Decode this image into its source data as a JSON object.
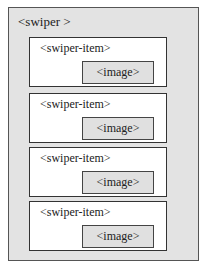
{
  "diagram": {
    "container": {
      "label": "<swiper >"
    },
    "items": [
      {
        "label": "<swiper-item>",
        "child": "<image>"
      },
      {
        "label": "<swiper-item>",
        "child": "<image>"
      },
      {
        "label": "<swiper-item>",
        "child": "<image>"
      },
      {
        "label": "<swiper-item>",
        "child": "<image>"
      }
    ],
    "colors": {
      "container_bg": "#e3e3e3",
      "item_bg": "#ffffff",
      "image_bg": "#e0e0e0",
      "border": "#333333"
    }
  }
}
